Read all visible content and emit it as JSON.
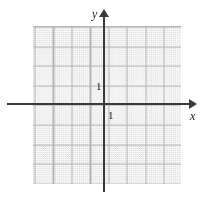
{
  "figure": {
    "kind": "cartesian-coordinate-grid"
  },
  "axes": {
    "y_label": "y",
    "x_label": "x",
    "x_arrow": "arrow-right",
    "y_arrow": "arrow-up",
    "axis_color": "#3a3a3a"
  },
  "ticks": {
    "y_unit_label": "1",
    "x_unit_label": "1"
  },
  "chart_data": {
    "type": "scatter",
    "title": "",
    "xlabel": "x",
    "ylabel": "y",
    "x": [],
    "y": [],
    "series": [],
    "xlim": [
      -4,
      4
    ],
    "ylim": [
      -4,
      4.5
    ],
    "xticks": [
      1
    ],
    "yticks": [
      1
    ],
    "xtick_labels": [
      "1"
    ],
    "ytick_labels": [
      "1"
    ],
    "grid": true,
    "grid_style": "dotted",
    "grid_major_spacing": 1,
    "grid_minor_per_major": 5,
    "legend": "none",
    "annotations": [],
    "colors": {
      "grid_minor": "#c9c9c9",
      "grid_major": "#b4b4b4",
      "axis": "#3a3a3a",
      "background": "#ffffff"
    }
  }
}
